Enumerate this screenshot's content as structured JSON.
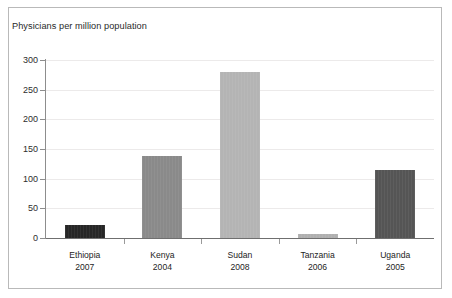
{
  "chart_data": {
    "type": "bar",
    "title": "Physicians per million population",
    "xlabel": "",
    "ylabel": "",
    "ylim": [
      0,
      300
    ],
    "yticks": [
      0,
      50,
      100,
      150,
      200,
      250,
      300
    ],
    "grid": true,
    "legend": "none",
    "categories": [
      "Ethiopia",
      "Kenya",
      "Sudan",
      "Tanzania",
      "Uganda"
    ],
    "years": [
      "2007",
      "2004",
      "2008",
      "2006",
      "2005"
    ],
    "values": [
      22,
      138,
      279,
      6,
      115
    ],
    "bar_colors": [
      "#262626",
      "#8a8a8a",
      "#b4b4b4",
      "#b0b0b0",
      "#555555"
    ],
    "bars": [
      {
        "category": "Ethiopia",
        "year": "2007",
        "value": 22,
        "color": "#262626"
      },
      {
        "category": "Kenya",
        "year": "2004",
        "value": 138,
        "color": "#8a8a8a"
      },
      {
        "category": "Sudan",
        "year": "2008",
        "value": 279,
        "color": "#b4b4b4"
      },
      {
        "category": "Tanzania",
        "year": "2006",
        "value": 6,
        "color": "#b0b0b0"
      },
      {
        "category": "Uganda",
        "year": "2005",
        "value": 115,
        "color": "#555555"
      }
    ]
  },
  "axis": {
    "y_tick_labels": [
      "300",
      "250",
      "200",
      "150",
      "100",
      "50",
      "0"
    ]
  },
  "colors": {
    "frame": "#b9b9b9",
    "gridline": "#eceaea",
    "axis": "#8d8d8d",
    "text": "#2a2a2a",
    "background": "#ffffff"
  }
}
